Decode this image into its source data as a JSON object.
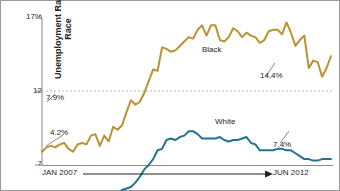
{
  "figure": {
    "border_color": "#9a9a9a",
    "background": "#ffffff"
  },
  "axis": {
    "ylabel": "Unemployment Rate by Race",
    "yticks": [
      "17%",
      "12",
      "7"
    ],
    "x_start_label": "JAN 2007",
    "x_end_label": "JUN 2012",
    "axis_color": "#8a8a8a",
    "gridline_value": 12,
    "gridline_style": "dotted"
  },
  "annotations": {
    "black_series_label": "Black",
    "white_series_label": "White",
    "black_start_value": "7.9%",
    "black_end_value": "14.4%",
    "white_start_value": "4.2%",
    "white_end_value": "7.4%"
  },
  "chart_data": {
    "type": "line",
    "title": "",
    "xlabel": "",
    "ylabel": "Unemployment Rate by Race",
    "ylim": [
      7,
      17
    ],
    "yticks": [
      7,
      12,
      17
    ],
    "grid": true,
    "gridlines": [
      12
    ],
    "legend": "inline-series-labels",
    "x_range": [
      "JAN 2007",
      "JUN 2012"
    ],
    "x": [
      "2007-01",
      "2007-02",
      "2007-03",
      "2007-04",
      "2007-05",
      "2007-06",
      "2007-07",
      "2007-08",
      "2007-09",
      "2007-10",
      "2007-11",
      "2007-12",
      "2008-01",
      "2008-02",
      "2008-03",
      "2008-04",
      "2008-05",
      "2008-06",
      "2008-07",
      "2008-08",
      "2008-09",
      "2008-10",
      "2008-11",
      "2008-12",
      "2009-01",
      "2009-02",
      "2009-03",
      "2009-04",
      "2009-05",
      "2009-06",
      "2009-07",
      "2009-08",
      "2009-09",
      "2009-10",
      "2009-11",
      "2009-12",
      "2010-01",
      "2010-02",
      "2010-03",
      "2010-04",
      "2010-05",
      "2010-06",
      "2010-07",
      "2010-08",
      "2010-09",
      "2010-10",
      "2010-11",
      "2010-12",
      "2011-01",
      "2011-02",
      "2011-03",
      "2011-04",
      "2011-05",
      "2011-06",
      "2011-07",
      "2011-08",
      "2011-09",
      "2011-10",
      "2011-11",
      "2011-12",
      "2012-01",
      "2012-02",
      "2012-03",
      "2012-04",
      "2012-05",
      "2012-06"
    ],
    "series": [
      {
        "name": "Black",
        "color": "#bb9231",
        "start_value": 7.9,
        "end_value": 14.4,
        "peak_value": 16.7,
        "values": [
          7.9,
          8.2,
          8.3,
          8.2,
          8.4,
          8.5,
          8.1,
          7.9,
          8.4,
          8.5,
          8.4,
          9.0,
          9.1,
          8.3,
          9.0,
          8.6,
          9.6,
          9.4,
          9.7,
          10.6,
          11.4,
          11.1,
          11.3,
          11.9,
          12.7,
          13.5,
          13.4,
          15.0,
          14.9,
          14.7,
          14.8,
          15.1,
          15.4,
          15.7,
          15.6,
          16.2,
          16.5,
          15.8,
          16.5,
          16.5,
          15.5,
          15.4,
          15.7,
          16.3,
          16.1,
          15.7,
          16.0,
          15.8,
          15.7,
          15.3,
          15.5,
          16.1,
          16.2,
          16.2,
          15.9,
          16.7,
          16.0,
          15.1,
          15.5,
          15.8,
          13.6,
          14.1,
          14.0,
          13.0,
          13.6,
          14.4
        ]
      },
      {
        "name": "White",
        "color": "#21748f",
        "start_value": 4.2,
        "end_value": 7.4,
        "peak_value": 9.3,
        "values": [
          4.2,
          4.0,
          3.8,
          3.9,
          4.0,
          4.1,
          4.2,
          4.2,
          4.2,
          4.2,
          4.3,
          4.4,
          4.4,
          4.5,
          4.5,
          4.4,
          4.9,
          5.0,
          5.3,
          5.4,
          5.5,
          5.8,
          6.2,
          6.7,
          7.0,
          7.4,
          8.0,
          8.1,
          8.7,
          8.8,
          8.7,
          8.9,
          9.0,
          9.3,
          9.3,
          9.1,
          8.8,
          8.8,
          8.8,
          8.8,
          8.9,
          8.7,
          8.6,
          8.7,
          8.7,
          8.8,
          8.9,
          8.5,
          8.4,
          8.0,
          8.0,
          8.0,
          8.0,
          8.1,
          8.1,
          8.0,
          8.0,
          7.8,
          7.6,
          7.4,
          7.4,
          7.3,
          7.3,
          7.4,
          7.4,
          7.4
        ]
      }
    ]
  }
}
